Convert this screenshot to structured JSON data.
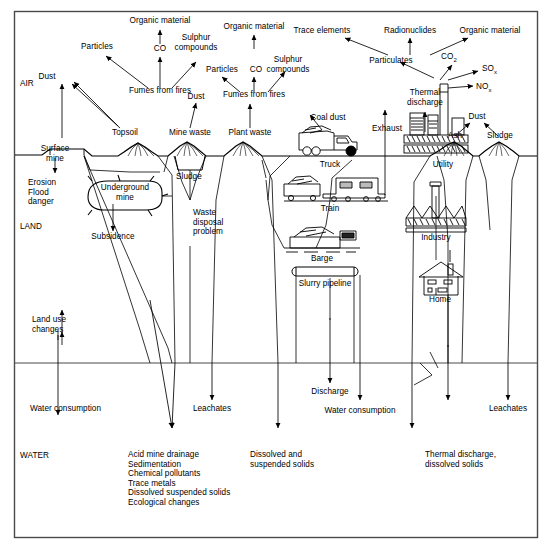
{
  "diagram": {
    "zones": [
      {
        "id": "air",
        "label": "AIR"
      },
      {
        "id": "land",
        "label": "LAND"
      },
      {
        "id": "water",
        "label": "WATER"
      }
    ],
    "air_emissions": [
      {
        "id": "organic-material-1",
        "label": "Organic material"
      },
      {
        "id": "particles-1",
        "label": "Particles"
      },
      {
        "id": "co-1",
        "label": "CO"
      },
      {
        "id": "sulphur-compounds-1",
        "label": "Sulphur\ncompounds"
      },
      {
        "id": "fumes-from-fires-1",
        "label": "Fumes from fires"
      },
      {
        "id": "organic-material-2",
        "label": "Organic material"
      },
      {
        "id": "particles-2",
        "label": "Particles"
      },
      {
        "id": "co-2",
        "label": "CO"
      },
      {
        "id": "sulphur-compounds-2",
        "label": "Sulphur\ncompounds"
      },
      {
        "id": "fumes-from-fires-2",
        "label": "Fumes from fires"
      },
      {
        "id": "trace-elements",
        "label": "Trace elements"
      },
      {
        "id": "radionuclides",
        "label": "Radionuclides"
      },
      {
        "id": "organic-material-3",
        "label": "Organic material"
      },
      {
        "id": "particulates",
        "label": "Particulates"
      },
      {
        "id": "co2",
        "label": "CO",
        "sub": "2"
      },
      {
        "id": "sox",
        "label": "SO",
        "sub": "x"
      },
      {
        "id": "nox",
        "label": "NO",
        "sub": "x"
      },
      {
        "id": "dust-1",
        "label": "Dust"
      },
      {
        "id": "dust-2",
        "label": "Dust"
      },
      {
        "id": "dust-3",
        "label": "Dust"
      },
      {
        "id": "coal-dust",
        "label": "Coal dust"
      },
      {
        "id": "exhaust",
        "label": "Exhaust"
      },
      {
        "id": "thermal-discharge-air",
        "label": "Thermal\ndischarge"
      }
    ],
    "surface_features": [
      {
        "id": "surface-mine",
        "label": "Surface\nmine"
      },
      {
        "id": "topsoil",
        "label": "Topsoil"
      },
      {
        "id": "mine-waste",
        "label": "Mine waste"
      },
      {
        "id": "plant-waste",
        "label": "Plant waste"
      },
      {
        "id": "truck",
        "label": "Truck"
      },
      {
        "id": "utility",
        "label": "Utility"
      },
      {
        "id": "ash",
        "label": "Ash"
      },
      {
        "id": "sludge-pile",
        "label": "Sludge"
      }
    ],
    "land_items": [
      {
        "id": "erosion-flood-danger",
        "label": "Erosion\nFlood\ndanger"
      },
      {
        "id": "underground-mine",
        "label": "Underground\nmine"
      },
      {
        "id": "subsidence",
        "label": "Subsidence"
      },
      {
        "id": "sludge",
        "label": "Sludge"
      },
      {
        "id": "waste-disposal-problem",
        "label": "Waste\ndisposal\nproblem"
      },
      {
        "id": "land-use-changes",
        "label": "Land use\nchanges"
      },
      {
        "id": "train",
        "label": "Train"
      },
      {
        "id": "barge",
        "label": "Barge"
      },
      {
        "id": "slurry-pipeline",
        "label": "Slurry pipeline"
      },
      {
        "id": "industry",
        "label": "Industry"
      },
      {
        "id": "home",
        "label": "Home"
      }
    ],
    "water_items": [
      {
        "id": "water-consumption-1",
        "label": "Water consumption"
      },
      {
        "id": "leachates-1",
        "label": "Leachates"
      },
      {
        "id": "discharge",
        "label": "Discharge"
      },
      {
        "id": "water-consumption-2",
        "label": "Water consumption"
      },
      {
        "id": "leachates-2",
        "label": "Leachates"
      },
      {
        "id": "acid-mine-drainage",
        "label": "Acid mine drainage\nSedimentation\nChemical pollutants\nTrace metals\nDissolved suspended solids\nEcological changes"
      },
      {
        "id": "dissolved-suspended-solids",
        "label": "Dissolved and\nsuspended solids"
      },
      {
        "id": "thermal-discharge-water",
        "label": "Thermal discharge,\ndissolved solids"
      }
    ],
    "colors": {
      "stroke": "#000000",
      "background": "#ffffff",
      "frame": "#3a3a3a"
    }
  }
}
